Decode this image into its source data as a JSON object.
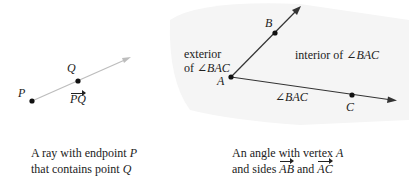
{
  "left_figure": {
    "points": [
      {
        "name": "P",
        "x": 32,
        "y": 101
      },
      {
        "name": "Q",
        "x": 78,
        "y": 81
      }
    ],
    "ray": {
      "from": "P",
      "to_x": 130,
      "to_y": 58,
      "color": "#bdbdbd"
    },
    "labels": {
      "P": "P",
      "Q": "Q",
      "ray_name": "PQ"
    },
    "caption": {
      "line1_prefix": "A ray with endpoint ",
      "line1_var": "P",
      "line2_prefix": "that contains point ",
      "line2_var": "Q"
    }
  },
  "right_figure": {
    "vertex": {
      "name": "A",
      "x": 231,
      "y": 77
    },
    "points": [
      {
        "name": "B",
        "x": 275,
        "y": 33
      },
      {
        "name": "C",
        "x": 352,
        "y": 95
      }
    ],
    "rays": [
      {
        "name": "AB",
        "to_x": 301,
        "to_y": 6
      },
      {
        "name": "AC",
        "to_x": 396,
        "to_y": 100
      }
    ],
    "ray_color": "#333333",
    "labels": {
      "A": "A",
      "B": "B",
      "C": "C",
      "exterior_line1": "exterior",
      "exterior_line2_prefix": "of ",
      "exterior_line2_angle": "∠BAC",
      "interior_prefix": "interior of ",
      "interior_angle": "∠BAC",
      "angle_name": "∠BAC"
    },
    "caption": {
      "line1_prefix": "An angle with vertex ",
      "line1_var": "A",
      "line2_prefix": "and sides ",
      "side1": "AB",
      "line2_mid": " and ",
      "side2": "AC"
    }
  },
  "colors": {
    "background": "#ffffff",
    "shading": "#f3f3f3",
    "text": "#222222",
    "point": "#111111"
  }
}
